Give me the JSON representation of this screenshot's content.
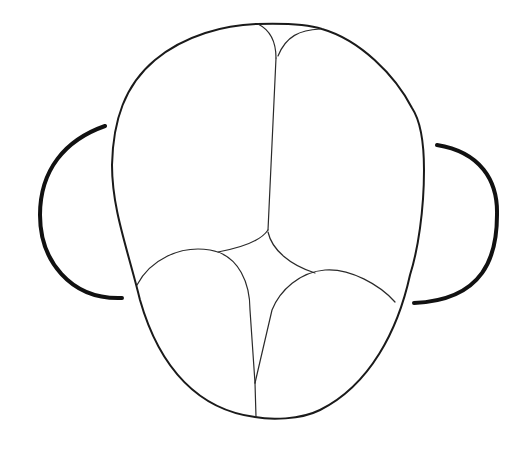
{
  "diagram": {
    "title": "",
    "colors": {
      "background": "#ffffff",
      "stroke": "#1a1a1a"
    },
    "parts": [
      {
        "id": "skull-outline",
        "label": ""
      },
      {
        "id": "left-ear",
        "label": ""
      },
      {
        "id": "right-ear",
        "label": ""
      },
      {
        "id": "sagittal-suture",
        "label": ""
      },
      {
        "id": "lambdoid-sutures",
        "label": ""
      },
      {
        "id": "anterior-sutures",
        "label": ""
      }
    ]
  }
}
